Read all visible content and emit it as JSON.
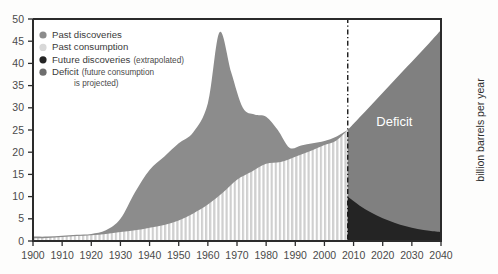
{
  "chart_data": {
    "type": "area",
    "title": "",
    "subtitle": "",
    "xlabel": "",
    "ylabel": "billion barrels per year",
    "xlim": [
      1900,
      2040
    ],
    "ylim": [
      0,
      50
    ],
    "grid": false,
    "legend_position": "top-left",
    "x_ticks": [
      "1900",
      "1910",
      "1920",
      "1930",
      "1940",
      "1950",
      "1960",
      "1970",
      "1980",
      "1990",
      "2000",
      "2010",
      "2020",
      "2030",
      "2040"
    ],
    "y_ticks": [
      "0",
      "5",
      "10",
      "15",
      "20",
      "25",
      "30",
      "35",
      "40",
      "45",
      "50"
    ],
    "annotations": [
      {
        "text": "Deficit",
        "x": 2024,
        "y": 26,
        "color": "#ffffff"
      }
    ],
    "projection_divider_year": 2008,
    "legend": [
      {
        "label": "Past discoveries",
        "note": "",
        "color": "#8c8c8c",
        "marker": "circle"
      },
      {
        "label": "Past consumption",
        "note": "",
        "color": "#d8d8d8",
        "marker": "circle"
      },
      {
        "label": "Future discoveries",
        "note": "(extrapolated)",
        "color": "#242424",
        "marker": "circle"
      },
      {
        "label": "Deficit",
        "note": "(future consumption",
        "note2": "is projected)",
        "color": "#6e6e6e",
        "marker": "circle"
      }
    ],
    "series": [
      {
        "name": "Past discoveries",
        "color": "#8c8c8c",
        "x": [
          1900,
          1905,
          1910,
          1915,
          1920,
          1925,
          1930,
          1935,
          1940,
          1945,
          1950,
          1955,
          1960,
          1964,
          1968,
          1972,
          1976,
          1980,
          1984,
          1988,
          1992,
          1996,
          2000,
          2004,
          2008
        ],
        "values": [
          1.0,
          1.0,
          1.2,
          1.4,
          1.6,
          2.4,
          5.0,
          11.0,
          16.0,
          19.0,
          22.0,
          24.5,
          31.0,
          47.0,
          38.0,
          30.0,
          28.5,
          28.0,
          25.0,
          21.0,
          21.5,
          22.0,
          22.5,
          23.5,
          25.0
        ]
      },
      {
        "name": "Past consumption",
        "color": "#d8d8d8",
        "x": [
          1900,
          1905,
          1910,
          1915,
          1920,
          1925,
          1930,
          1935,
          1940,
          1945,
          1950,
          1955,
          1960,
          1965,
          1970,
          1975,
          1980,
          1985,
          1990,
          1995,
          2000,
          2004,
          2008
        ],
        "values": [
          0.6,
          0.7,
          0.9,
          1.1,
          1.3,
          1.6,
          2.0,
          2.4,
          3.0,
          3.6,
          4.6,
          6.2,
          8.2,
          10.8,
          13.8,
          15.6,
          17.4,
          17.8,
          19.0,
          20.2,
          21.6,
          22.6,
          25.0
        ]
      },
      {
        "name": "Future discoveries",
        "color": "#242424",
        "x": [
          2008,
          2012,
          2016,
          2020,
          2024,
          2028,
          2032,
          2036,
          2040
        ],
        "values": [
          10.0,
          8.0,
          6.4,
          5.1,
          4.1,
          3.3,
          2.7,
          2.3,
          2.0
        ]
      },
      {
        "name": "Deficit",
        "color": "#808080",
        "x": [
          2008,
          2012,
          2016,
          2020,
          2024,
          2028,
          2032,
          2036,
          2040
        ],
        "values": [
          25.0,
          27.8,
          30.6,
          33.4,
          36.2,
          39.0,
          41.8,
          44.6,
          47.5
        ]
      }
    ]
  },
  "axes": {
    "y_axis_title": "billion barrels per year"
  }
}
